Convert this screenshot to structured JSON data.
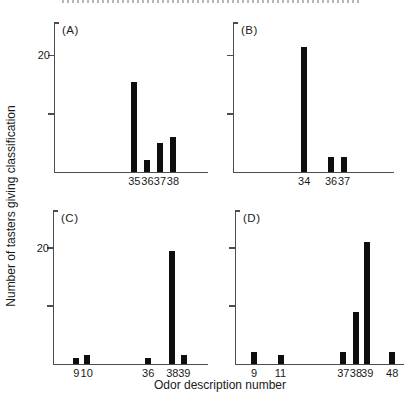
{
  "figure": {
    "ylabel": "Number of tasters giving classification",
    "xlabel": "Odor description number",
    "colors": {
      "bar": "#0e0e0e",
      "axis": "#4d4d4d",
      "text": "#1a1a1a",
      "background": "#ffffff"
    }
  },
  "chart_data": [
    {
      "type": "bar",
      "panel_label": "(A)",
      "xlabel": "Odor description number",
      "ylabel": "Number of tasters giving classification",
      "ylim": [
        0,
        25.7
      ],
      "grid": false,
      "yticks": [
        {
          "value": 10,
          "label": ""
        },
        {
          "value": 20,
          "label": "20"
        }
      ],
      "bars": [
        {
          "x": "35",
          "value": 15.5,
          "cx": 0.518
        },
        {
          "x": "36",
          "value": 2,
          "cx": 0.604
        },
        {
          "x": "37",
          "value": 5,
          "cx": 0.686
        },
        {
          "x": "38",
          "value": 6,
          "cx": 0.771
        }
      ]
    },
    {
      "type": "bar",
      "panel_label": "(B)",
      "xlabel": "Odor description number",
      "ylabel": "Number of tasters giving classification",
      "ylim": [
        0,
        25.7
      ],
      "grid": false,
      "yticks": [
        {
          "value": 10,
          "label": ""
        },
        {
          "value": 20,
          "label": ""
        }
      ],
      "bars": [
        {
          "x": "34",
          "value": 21.5,
          "cx": 0.439
        },
        {
          "x": "36",
          "value": 2.5,
          "cx": 0.607
        },
        {
          "x": "37",
          "value": 2.5,
          "cx": 0.688
        }
      ]
    },
    {
      "type": "bar",
      "panel_label": "(C)",
      "xlabel": "Odor description number",
      "ylabel": "Number of tasters giving classification",
      "ylim": [
        0,
        26.5
      ],
      "grid": false,
      "yticks": [
        {
          "value": 10,
          "label": ""
        },
        {
          "value": 20,
          "label": "20"
        }
      ],
      "bars": [
        {
          "x": "9",
          "value": 1,
          "cx": 0.145
        },
        {
          "x": "10",
          "value": 1.5,
          "cx": 0.212
        },
        {
          "x": "36",
          "value": 1,
          "cx": 0.612
        },
        {
          "x": "38",
          "value": 19.5,
          "cx": 0.768
        },
        {
          "x": "39",
          "value": 1.5,
          "cx": 0.846
        }
      ]
    },
    {
      "type": "bar",
      "panel_label": "(D)",
      "xlabel": "Odor description number",
      "ylabel": "Number of tasters giving classification",
      "ylim": [
        0,
        26.5
      ],
      "grid": false,
      "yticks": [
        {
          "value": 10,
          "label": ""
        },
        {
          "value": 20,
          "label": ""
        }
      ],
      "bars": [
        {
          "x": "9",
          "value": 2,
          "cx": 0.107
        },
        {
          "x": "11",
          "value": 1.5,
          "cx": 0.265
        },
        {
          "x": "37",
          "value": 2,
          "cx": 0.639
        },
        {
          "x": "38",
          "value": 9,
          "cx": 0.714
        },
        {
          "x": "39",
          "value": 21,
          "cx": 0.781
        },
        {
          "x": "48",
          "value": 2,
          "cx": 0.93
        }
      ]
    }
  ]
}
